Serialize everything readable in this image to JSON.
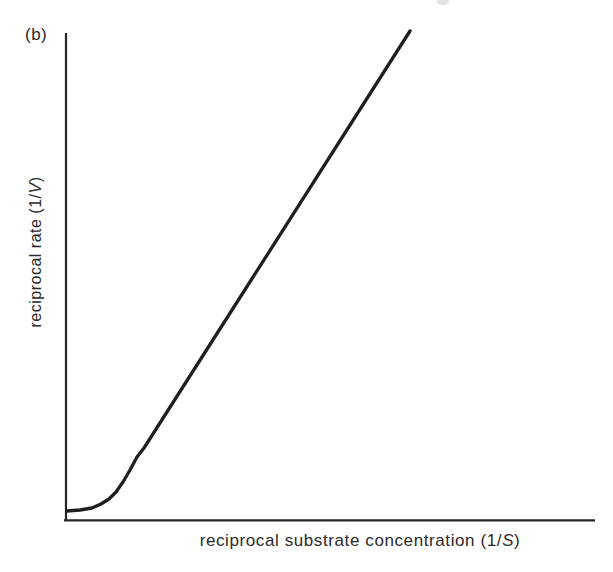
{
  "figure": {
    "panel_label": "(b)",
    "background_color": "#ffffff",
    "line_color": "#1f1f1f",
    "axis_color": "#242424"
  },
  "axes": {
    "ylabel": {
      "prefix": "reciprocal rate (1/",
      "variable": "V",
      "suffix": ")"
    },
    "xlabel": {
      "prefix": "reciprocal substrate concentration (1/",
      "variable": "S",
      "suffix": ")"
    }
  },
  "chart_data": {
    "type": "line",
    "title": "",
    "panel_label": "(b)",
    "xlabel": "reciprocal substrate concentration (1/S)",
    "ylabel": "reciprocal rate (1/V)",
    "x_ticks": [],
    "y_ticks": [],
    "grid": false,
    "legend": false,
    "axis_ranges": "unlabeled qualitative sketch; both axes start at origin with no tick marks",
    "series": [
      {
        "name": "reciprocal-rate-curve",
        "points_px": [
          [
            67,
            511
          ],
          [
            80,
            510
          ],
          [
            92,
            508
          ],
          [
            101,
            504
          ],
          [
            109,
            499
          ],
          [
            116,
            492
          ],
          [
            123,
            482
          ],
          [
            130,
            470
          ],
          [
            137,
            457
          ],
          [
            144,
            448
          ],
          [
            410,
            31
          ]
        ]
      }
    ],
    "plot_frame_px": {
      "y_axis_x": 66,
      "x_axis_y": 520,
      "y_axis_top": 33,
      "x_axis_right": 595
    }
  }
}
